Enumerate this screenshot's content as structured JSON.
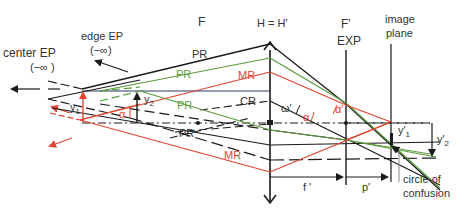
{
  "diagram": {
    "title_labels": {
      "center_ep": "center EP",
      "center_ep_inf": "(−∞ )",
      "edge_ep": "edge EP",
      "edge_ep_inf": "(−∞)",
      "front_focal": "F",
      "principal_planes": "H = H'",
      "back_focal": "F'",
      "exit_pupil": "EXP",
      "image_plane_line1": "image",
      "image_plane_line2": "plane",
      "coc_line1": "circle of",
      "coc_line2": "confusion"
    },
    "ray_labels": {
      "pr_top": "PR",
      "pr_green_upper": "PR",
      "mr_upper": "MR",
      "pr_green_lower": "PR",
      "cr": "CR",
      "pr_lower": "PR",
      "mr_lower": "MR"
    },
    "symbol_labels": {
      "y1": "y",
      "y1_sub": "1",
      "y2": "y",
      "y2_sub": "2",
      "alpha": "α",
      "omega_prime": "ω'",
      "alpha_mid": "α",
      "alpha_prime": "α'",
      "y1_prime": "y'",
      "y1_prime_sub": "1",
      "y2_prime": "y'",
      "y2_prime_sub": "2",
      "f_prime": "f '",
      "p_prime": "p'"
    },
    "colors": {
      "black_ray": "#1a1a1a",
      "green_ray": "#5a9a3c",
      "red_ray": "#e0452f",
      "axis_blue": "#2b3a66",
      "text": "#333333"
    }
  }
}
